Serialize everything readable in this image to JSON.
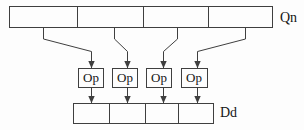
{
  "diagram": {
    "top_register": {
      "label": "Qn",
      "segment_count": 4
    },
    "operators": [
      {
        "label": "Op"
      },
      {
        "label": "Op"
      },
      {
        "label": "Op"
      },
      {
        "label": "Op"
      }
    ],
    "bottom_register": {
      "label": "Dd",
      "segment_count": 4
    },
    "colors": {
      "line": "#3f3f3f",
      "text": "#161616",
      "background": "#fdfdfd"
    }
  }
}
